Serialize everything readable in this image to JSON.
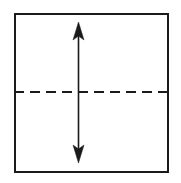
{
  "figure": {
    "title": "Square with horizontal dashed midline and vertical double-headed arrow",
    "type": "geometry-diagram",
    "canvas": {
      "width": 181,
      "height": 183,
      "background_color": "#ffffff"
    },
    "square": {
      "name": "square-outline",
      "description": "Square outline",
      "x": 14,
      "y": 13,
      "width": 155,
      "height": 160,
      "stroke_color": "#1a1a1a",
      "stroke_width": 2.2,
      "fill": "none"
    },
    "dashed_line": {
      "name": "horizontal-dashed-midline",
      "description": "Horizontal dashed line at vertical midpoint of square",
      "x1": 14,
      "y1": 92,
      "x2": 169,
      "y2": 92,
      "stroke_color": "#1a1a1a",
      "stroke_width": 2,
      "dash_length": 10,
      "gap_length": 6,
      "dash_array": "10 6"
    },
    "double_arrow": {
      "name": "vertical-double-headed-arrow",
      "description": "Vertical double-headed arrow crossing the dashed midline",
      "x": 78.5,
      "y_top": 22,
      "y_bottom": 163,
      "stroke_color": "#1a1a1a",
      "stroke_width": 1.6,
      "head_width": 11,
      "head_length": 18,
      "head_notch": 4,
      "head_fill": "#1a1a1a"
    }
  }
}
